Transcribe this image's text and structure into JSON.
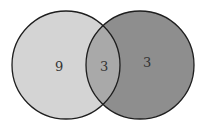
{
  "diagram": {
    "type": "venn",
    "sets": [
      {
        "name": "left",
        "only_count": "9",
        "color": "#d4d4d4"
      },
      {
        "name": "right",
        "only_count": "3",
        "color": "#8e8e8e"
      }
    ],
    "intersection": {
      "count": "3",
      "color": "#a9a9a9"
    },
    "stroke": "#1e1e1e"
  }
}
